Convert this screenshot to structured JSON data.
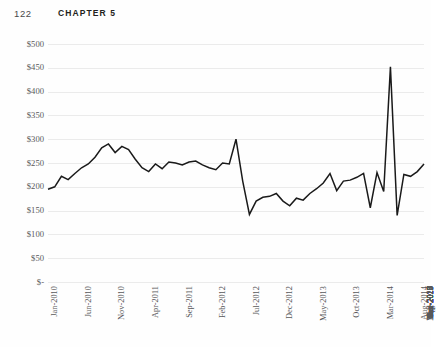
{
  "page": {
    "folio": "122",
    "chapter_label": "CHAPTER 5"
  },
  "figure": {
    "background_color": "#fefefe",
    "line_color": "#1a1a1a",
    "gridline_color": "#ebebeb",
    "tick_text_color": "#58585a"
  },
  "chart_data": {
    "type": "line",
    "title": "",
    "subtitle": "",
    "xlabel": "",
    "ylabel": "",
    "grid": true,
    "legend_position": "none",
    "ylim": [
      0,
      500
    ],
    "ytick_values": [
      500,
      450,
      400,
      350,
      300,
      250,
      200,
      150,
      100,
      50,
      0
    ],
    "ytick_labels": [
      "$500",
      "$450",
      "$400",
      "$350",
      "$300",
      "$250",
      "$200",
      "$150",
      "$100",
      "$50",
      "$-"
    ],
    "xtick_labels": [
      "Jan-2010",
      "Jun-2010",
      "Nov-2010",
      "Apr-2011",
      "Sep-2011",
      "Feb-2012",
      "Jul-2012",
      "Dec-2012",
      "May-2013",
      "Oct-2013",
      "Mar-2014",
      "Aug-2014",
      "Jan-2015",
      "Jun-2015",
      "Nov-2015",
      "Apr-2016",
      "Sep-2016",
      "Feb-2017",
      "Jul-2017",
      "Dec-2017",
      "May-2018",
      "Oct-2018",
      "Mar-2019",
      "Aug-2019",
      "Jan-2020",
      "Jun-2020"
    ],
    "xtick_interval_months": 5,
    "x_start": "Jan-2010",
    "x_end": "Jun-2020",
    "series": [
      {
        "name": "Price",
        "values": [
          195,
          200,
          222,
          215,
          228,
          240,
          248,
          262,
          282,
          290,
          272,
          285,
          278,
          258,
          240,
          232,
          248,
          238,
          252,
          250,
          246,
          252,
          254,
          246,
          240,
          236,
          250,
          248,
          300,
          212,
          142,
          170,
          178,
          180,
          186,
          170,
          160,
          176,
          172,
          186,
          196,
          208,
          228,
          192,
          212,
          214,
          220,
          228,
          156,
          230,
          190,
          452,
          140,
          226,
          222,
          232,
          248
        ]
      }
    ],
    "annotations": [
      {
        "label": "peak",
        "x": "Aug-2019",
        "y": 452
      },
      {
        "label": "trough",
        "x": "Sep-2019",
        "y": 140
      },
      {
        "label": "mid-spike",
        "x": "Jun-2015",
        "y": 300
      }
    ]
  }
}
